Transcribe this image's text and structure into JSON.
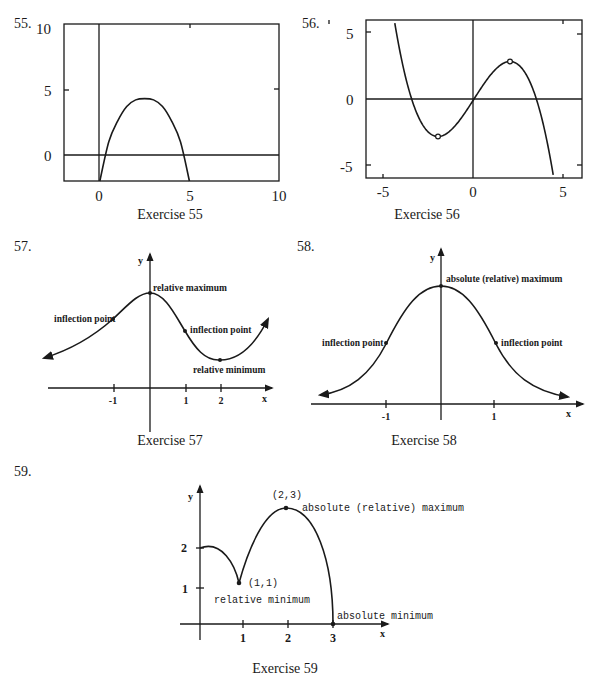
{
  "chart_data": [
    {
      "id": "ex55",
      "type": "line",
      "number_label": "55.",
      "caption": "Exercise 55",
      "xlim": [
        -2,
        10
      ],
      "ylim": [
        -2,
        10
      ],
      "xticks": [
        "0",
        "5",
        "10"
      ],
      "yticks": [
        "0",
        "5",
        "10"
      ],
      "grid": false,
      "series": [
        {
          "name": "f(x)",
          "x": [
            0,
            0.5,
            1,
            1.5,
            2,
            2.5,
            3,
            3.5,
            4,
            4.5,
            5
          ],
          "y": [
            -2,
            1.0,
            2.6,
            3.7,
            4.2,
            4.3,
            4.2,
            3.7,
            2.6,
            1.0,
            -2
          ]
        }
      ]
    },
    {
      "id": "ex56",
      "type": "line",
      "number_label": "56.",
      "caption": "Exercise 56",
      "xlim": [
        -6,
        6
      ],
      "ylim": [
        -5.9,
        5.9
      ],
      "xticks": [
        "-5",
        "0",
        "5"
      ],
      "yticks": [
        "5",
        "0",
        "-5"
      ],
      "grid": false,
      "series": [
        {
          "name": "f(x)",
          "x_range": [
            -4.4,
            4.4
          ],
          "formula": "2.1x - 0.175x^3"
        }
      ],
      "marked_points": [
        {
          "x": -2,
          "y": -2.8
        },
        {
          "x": 2,
          "y": 2.8
        }
      ]
    },
    {
      "id": "ex57",
      "type": "line",
      "number_label": "57.",
      "caption": "Exercise 57",
      "axis_x_label": "x",
      "axis_y_label": "y",
      "xticks": [
        "-1",
        "1",
        "2"
      ],
      "annotations": [
        {
          "text": "relative maximum",
          "x": 0
        },
        {
          "text": "inflection point",
          "x": -1
        },
        {
          "text": "inflection point",
          "x": 1
        },
        {
          "text": "relative minimum",
          "x": 2
        }
      ]
    },
    {
      "id": "ex58",
      "type": "line",
      "number_label": "58.",
      "caption": "Exercise 58",
      "axis_x_label": "x",
      "axis_y_label": "y",
      "xticks": [
        "-1",
        "1"
      ],
      "annotations": [
        {
          "text": "absolute (relative) maximum",
          "x": 0
        },
        {
          "text": "inflection point",
          "x": -1
        },
        {
          "text": "inflection point",
          "x": 1
        }
      ]
    },
    {
      "id": "ex59",
      "type": "line",
      "number_label": "59.",
      "caption": "Exercise 59",
      "axis_x_label": "x",
      "axis_y_label": "y",
      "xticks": [
        "1",
        "2",
        "3"
      ],
      "yticks": [
        "1",
        "2"
      ],
      "points": [
        {
          "label": "(2,3)",
          "x": 2,
          "y": 3,
          "note": "absolute (relative) maximum"
        },
        {
          "label": "(1,1)",
          "x": 1,
          "y": 1,
          "note": "relative minimum"
        },
        {
          "label": "",
          "x": 3,
          "y": 0,
          "note": "absolute minimum"
        }
      ]
    }
  ]
}
